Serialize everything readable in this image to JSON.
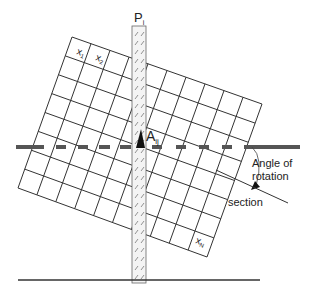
{
  "diagram": {
    "strip_label": "P",
    "strip_subscript": "i",
    "cell_labels": {
      "x1": "x",
      "x1_sub": "1",
      "x2": "x",
      "x2_sub": "2",
      "xN": "x",
      "xN_sub": "N"
    },
    "intersection_label": "A",
    "intersection_subscript": "ij",
    "angle_label_line1": "Angle of",
    "angle_label_line2": "rotation",
    "section_label": "section",
    "grid": {
      "rows": 8,
      "cols": 10,
      "corner_tl": [
        72,
        37
      ],
      "corner_tr": [
        262,
        104
      ],
      "corner_bl": [
        18,
        188
      ],
      "corner_br": [
        207,
        257
      ]
    },
    "colors": {
      "line": "#333333",
      "dashed": "#555555",
      "hatch": "#777777"
    }
  }
}
